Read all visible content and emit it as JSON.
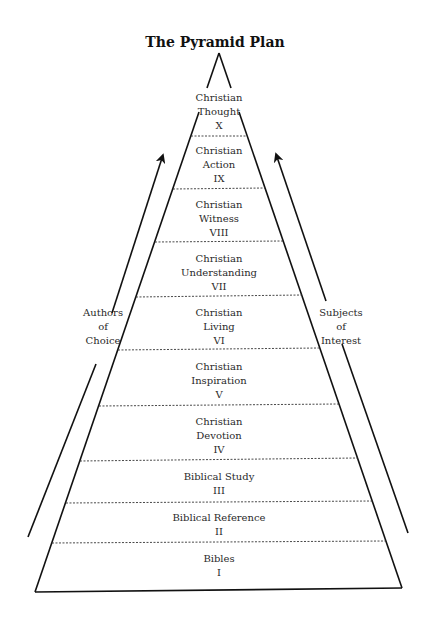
{
  "title": "The Pyramid Plan",
  "left_arrow_label": [
    "Authors",
    "of",
    "Choice"
  ],
  "right_arrow_label": [
    "Subjects",
    "of",
    "Interest"
  ],
  "tiers": [
    {
      "name": "Christian Thought",
      "line1": "Christian",
      "line2": "Thought",
      "numeral": "X"
    },
    {
      "name": "Christian Action",
      "line1": "Christian",
      "line2": "Action",
      "numeral": "IX"
    },
    {
      "name": "Christian Witness",
      "line1": "Christian",
      "line2": "Witness",
      "numeral": "VIII"
    },
    {
      "name": "Christian Understanding",
      "line1": "Christian",
      "line2": "Understanding",
      "numeral": "VII"
    },
    {
      "name": "Christian Living",
      "line1": "Christian",
      "line2": "Living",
      "numeral": "VI"
    },
    {
      "name": "Christian Inspiration",
      "line1": "Christian",
      "line2": "Inspiration",
      "numeral": "V"
    },
    {
      "name": "Christian Devotion",
      "line1": "Christian",
      "line2": "Devotion",
      "numeral": "IV"
    },
    {
      "name": "Biblical Study",
      "line1": "Biblical Study",
      "line2": "",
      "numeral": "III"
    },
    {
      "name": "Biblical Reference",
      "line1": "Biblical Reference",
      "line2": "",
      "numeral": "II"
    },
    {
      "name": "Bibles",
      "line1": "Bibles",
      "line2": "",
      "numeral": "I"
    }
  ]
}
